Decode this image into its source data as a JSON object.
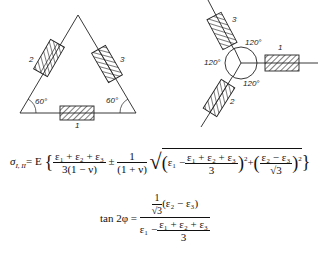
{
  "delta_rosette": {
    "gauges": [
      {
        "id": "gauge-1",
        "label": "1",
        "position": "bottom"
      },
      {
        "id": "gauge-2",
        "label": "2",
        "position": "left"
      },
      {
        "id": "gauge-3",
        "label": "3",
        "position": "right"
      }
    ],
    "angles": [
      {
        "label": "60°",
        "corner": "bottom-left"
      },
      {
        "label": "60°",
        "corner": "bottom-right"
      }
    ]
  },
  "star_rosette": {
    "gauges": [
      {
        "id": "gauge-1",
        "label": "1",
        "direction": "right"
      },
      {
        "id": "gauge-2",
        "label": "2",
        "direction": "lower-left"
      },
      {
        "id": "gauge-3",
        "label": "3",
        "direction": "upper-left"
      }
    ],
    "angles": [
      "120°",
      "120°",
      "120°"
    ]
  },
  "formula1": {
    "lhs": "σ",
    "lhs_sub": "I, II",
    "eq": "= E",
    "term1_num": "ε₁ + ε₂ + ε₃",
    "term1_den": "3(1 − ν)",
    "pm": "±",
    "term2_num": "1",
    "term2_den": "(1 + ν)",
    "inner_a": "ε₁ −",
    "inner_a_num": "ε₁ + ε₂ + ε₃",
    "inner_a_den": "3",
    "plus": "+",
    "inner_b_num": "ε₂ − ε₃",
    "inner_b_den": "√3",
    "sq": "2"
  },
  "formula2": {
    "lhs": "tan 2φ =",
    "num_frac_num": "1",
    "num_frac_den": "√3",
    "num_rest": "(ε₂ − ε₃)",
    "den_a": "ε₁ −",
    "den_frac_num": "ε₁ + ε₂ + ε₃",
    "den_frac_den": "3"
  }
}
